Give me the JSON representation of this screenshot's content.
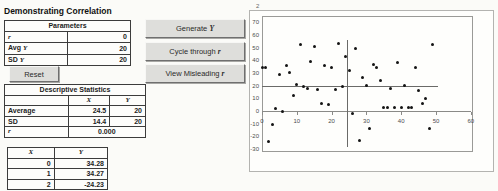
{
  "title": "Demonstrating Correlation",
  "parameters_table": {
    "header": "Parameters",
    "rows": [
      {
        "prefix": "",
        "var": "r",
        "value": "0"
      },
      {
        "prefix": "Avg ",
        "var": "Y",
        "value": "20"
      },
      {
        "prefix": "SD ",
        "var": "Y",
        "value": "20"
      }
    ]
  },
  "reset_button": "Reset",
  "action_buttons": [
    {
      "prefix": "Generate ",
      "var": "Y"
    },
    {
      "prefix": "Cycle through ",
      "var": "r"
    },
    {
      "prefix": "View Misleading ",
      "var": "r"
    }
  ],
  "descriptive_stats": {
    "header": "Descriptive Statistics",
    "col_x": "X",
    "col_y": "Y",
    "rows": [
      {
        "label": "Average",
        "x": "24.5",
        "y": "20"
      },
      {
        "label": "SD",
        "x": "14.4",
        "y": "20"
      }
    ],
    "r_label": "r",
    "r_value": "0.000"
  },
  "data_table": {
    "col_x": "X",
    "col_y": "Y",
    "rows": [
      {
        "x": "0",
        "y": "34.28"
      },
      {
        "x": "1",
        "y": "34.27"
      },
      {
        "x": "2",
        "y": "-24.23"
      }
    ]
  },
  "chart_data": {
    "type": "scatter",
    "title": "",
    "corner_label": "2",
    "xlabel": "",
    "ylabel": "",
    "xlim": [
      0,
      60
    ],
    "ylim": [
      -30,
      70
    ],
    "x_ticks": [
      0,
      10,
      20,
      30,
      40,
      50,
      60
    ],
    "y_ticks": [
      70,
      60,
      50,
      40,
      30,
      20,
      10,
      0,
      -10,
      -20,
      -30
    ],
    "grid": false,
    "legend": false,
    "x": [
      0,
      1,
      2,
      3,
      4,
      5,
      6,
      7,
      8,
      9,
      10,
      11,
      12,
      13,
      14,
      15,
      16,
      17,
      18,
      19,
      20,
      21,
      22,
      23,
      24,
      25,
      26,
      27,
      28,
      29,
      30,
      31,
      32,
      33,
      34,
      35,
      36,
      37,
      38,
      39,
      40,
      41,
      42,
      43,
      44,
      45,
      46,
      47,
      48,
      49
    ],
    "y": [
      34.28,
      34.27,
      -24.23,
      -11,
      2,
      29,
      0,
      36,
      30,
      12,
      21,
      52,
      19,
      18,
      39,
      51,
      17,
      6,
      36,
      5,
      34,
      17,
      53,
      19,
      43,
      32,
      -2,
      49,
      -23,
      26,
      20,
      -14,
      37,
      34,
      24,
      3,
      3,
      18,
      3,
      38,
      3,
      20,
      3,
      3,
      34,
      16,
      6,
      10,
      -14,
      52
    ],
    "mean_lines": {
      "x_mean": 24.5,
      "y_mean": 20,
      "h_extent": [
        0,
        50.5
      ],
      "v_extent": [
        -28,
        56
      ]
    }
  }
}
